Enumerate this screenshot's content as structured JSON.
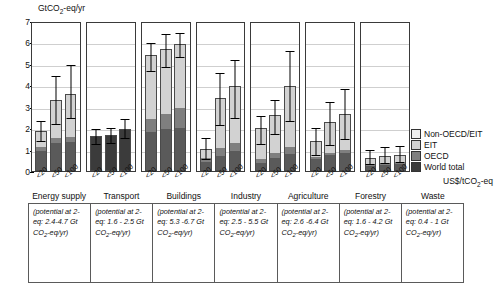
{
  "chart_data": {
    "type": "bar",
    "title": "GtCO2-eq/yr",
    "ylabel": "GtCO2-eq/yr",
    "xlabel": "US$/tCO2-eq",
    "ylim": [
      0,
      7
    ],
    "yticks": [
      0,
      1,
      2,
      3,
      4,
      5,
      6,
      7
    ],
    "grid": true,
    "legend_position": "right",
    "categories": [
      "<20",
      "<50",
      "<100"
    ],
    "series_names": [
      "World total",
      "OECD",
      "EIT",
      "Non-OECD/EIT"
    ],
    "sectors": [
      {
        "name": "Energy supply",
        "solid": false,
        "bars": [
          {
            "label": "<20",
            "world": 0.95,
            "oecd": 0.2,
            "eit": 0.75,
            "nonoecd": 0.0,
            "total": 1.9,
            "err_low": 1.35,
            "err_high": 2.3
          },
          {
            "label": "<50",
            "world": 1.3,
            "oecd": 0.25,
            "eit": 1.8,
            "nonoecd": 0.0,
            "total": 3.35,
            "err_low": 2.2,
            "err_high": 4.45
          },
          {
            "label": "<100",
            "world": 1.35,
            "oecd": 0.25,
            "eit": 2.05,
            "nonoecd": 0.0,
            "total": 3.65,
            "err_low": 2.45,
            "err_high": 4.95
          }
        ]
      },
      {
        "name": "Transport",
        "solid": true,
        "bars": [
          {
            "label": "<20",
            "world": 1.65,
            "oecd": 0.0,
            "eit": 0.0,
            "nonoecd": 0.0,
            "total": 1.65,
            "err_low": 1.25,
            "err_high": 1.95
          },
          {
            "label": "<50",
            "world": 1.7,
            "oecd": 0.0,
            "eit": 0.0,
            "nonoecd": 0.0,
            "total": 1.7,
            "err_low": 1.3,
            "err_high": 2.0
          },
          {
            "label": "<100",
            "world": 2.0,
            "oecd": 0.0,
            "eit": 0.0,
            "nonoecd": 0.0,
            "total": 2.0,
            "err_low": 1.5,
            "err_high": 2.4
          }
        ]
      },
      {
        "name": "Buildings",
        "solid": false,
        "bars": [
          {
            "label": "<20",
            "world": 1.85,
            "oecd": 0.6,
            "eit": 3.05,
            "nonoecd": 0.0,
            "total": 5.5,
            "err_low": 4.7,
            "err_high": 6.0
          },
          {
            "label": "<50",
            "world": 1.95,
            "oecd": 0.75,
            "eit": 3.05,
            "nonoecd": 0.0,
            "total": 5.75,
            "err_low": 4.85,
            "err_high": 6.45
          },
          {
            "label": "<100",
            "world": 2.0,
            "oecd": 1.0,
            "eit": 3.0,
            "nonoecd": 0.0,
            "total": 6.0,
            "err_low": 5.35,
            "err_high": 6.5
          }
        ]
      },
      {
        "name": "Industry",
        "solid": false,
        "bars": [
          {
            "label": "<20",
            "world": 0.4,
            "oecd": 0.2,
            "eit": 0.45,
            "nonoecd": 0.0,
            "total": 1.05,
            "err_low": 0.5,
            "err_high": 1.5
          },
          {
            "label": "<50",
            "world": 0.7,
            "oecd": 0.35,
            "eit": 2.4,
            "nonoecd": 0.0,
            "total": 3.45,
            "err_low": 2.15,
            "err_high": 4.6
          },
          {
            "label": "<100",
            "world": 0.9,
            "oecd": 0.4,
            "eit": 2.7,
            "nonoecd": 0.0,
            "total": 4.0,
            "err_low": 2.45,
            "err_high": 5.2
          }
        ]
      },
      {
        "name": "Agriculture",
        "solid": false,
        "bars": [
          {
            "label": "<20",
            "world": 0.35,
            "oecd": 0.2,
            "eit": 1.5,
            "nonoecd": 0.0,
            "total": 2.05,
            "err_low": 1.25,
            "err_high": 2.55
          },
          {
            "label": "<50",
            "world": 0.6,
            "oecd": 0.25,
            "eit": 1.8,
            "nonoecd": 0.0,
            "total": 2.65,
            "err_low": 1.7,
            "err_high": 3.3
          },
          {
            "label": "<100",
            "world": 0.8,
            "oecd": 0.3,
            "eit": 2.9,
            "nonoecd": 0.0,
            "total": 4.0,
            "err_low": 2.3,
            "err_high": 5.65
          }
        ]
      },
      {
        "name": "Forestry",
        "solid": false,
        "bars": [
          {
            "label": "<20",
            "world": 0.55,
            "oecd": 0.1,
            "eit": 0.75,
            "nonoecd": 0.0,
            "total": 1.4,
            "err_low": 0.7,
            "err_high": 2.0
          },
          {
            "label": "<50",
            "world": 0.75,
            "oecd": 0.1,
            "eit": 1.45,
            "nonoecd": 0.0,
            "total": 2.3,
            "err_low": 1.2,
            "err_high": 3.2
          },
          {
            "label": "<100",
            "world": 0.85,
            "oecd": 0.15,
            "eit": 1.7,
            "nonoecd": 0.0,
            "total": 2.7,
            "err_low": 1.45,
            "err_high": 3.85
          }
        ]
      },
      {
        "name": "Waste",
        "solid": false,
        "bars": [
          {
            "label": "<20",
            "world": 0.25,
            "oecd": 0.1,
            "eit": 0.25,
            "nonoecd": 0.0,
            "total": 0.6,
            "err_low": 0.3,
            "err_high": 0.95
          },
          {
            "label": "<50",
            "world": 0.3,
            "oecd": 0.1,
            "eit": 0.3,
            "nonoecd": 0.0,
            "total": 0.7,
            "err_low": 0.35,
            "err_high": 1.1
          },
          {
            "label": "<100",
            "world": 0.3,
            "oecd": 0.1,
            "eit": 0.35,
            "nonoecd": 0.0,
            "total": 0.75,
            "err_low": 0.4,
            "err_high": 1.15
          }
        ]
      }
    ]
  },
  "axis": {
    "y_title_main": "GtCO",
    "y_title_sub": "2",
    "y_title_tail": "-eq/yr",
    "y_ticks": [
      "7",
      "6",
      "5",
      "4",
      "3",
      "2",
      "1",
      "0"
    ],
    "x_unit_main": "US$/tCO",
    "x_unit_sub": "2",
    "x_unit_tail": "-eq"
  },
  "legend": {
    "items": [
      {
        "label": "Non-OECD/EIT",
        "color": "#efefef"
      },
      {
        "label": "EIT",
        "color": "#d2d2d2"
      },
      {
        "label": "OECD",
        "color": "#7f7f7f"
      },
      {
        "label": "World total",
        "color": "#3b3b3b"
      }
    ]
  },
  "table": {
    "headers": [
      "Energy supply",
      "Transport",
      "Buildings",
      "Industry",
      "Agriculture",
      "Forestry",
      "Waste"
    ],
    "notes": [
      "(potential at <US$100/tCO2-eq: 2.4-4.7 Gt CO2-eq/yr)",
      "(potential at <US$100/tCO2-eq: 1.6 - 2.5 Gt CO2-eq/yr)",
      "(potential at <US$100/tCO2-eq: 5.3 -6.7 Gt CO2-eq/yr)",
      "(potential at <US$100/tCO2-eq: 2.5 - 5.5 Gt CO2-eq/yr)",
      "(potential at <US$100/tCO2-eq: 2.6 -6.4 Gt CO2-eq/yr)",
      "(potential at <US$100/tCO2-eq: 1.6 - 4.2 Gt CO2-eq/yr)",
      "(potential at <US$100/tCO2-eq: 0.4 - 1 Gt CO2-eq/yr)"
    ]
  }
}
